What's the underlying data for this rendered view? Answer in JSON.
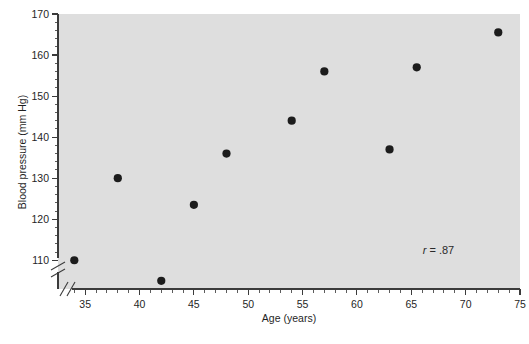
{
  "figure": {
    "background_color": "#ffffff",
    "plot_area_color": "#dedede",
    "point_color": "#1c1c1c"
  },
  "annotation": {
    "symbol": "r",
    "equals": "=",
    "value": ".87",
    "full_text": "r = .87"
  },
  "chart_data": {
    "type": "scatter",
    "title": "",
    "xlabel": "Age (years)",
    "ylabel": "Blood pressure (mm Hg)",
    "xlim": [
      32.5,
      75
    ],
    "ylim": [
      103,
      170
    ],
    "grid": false,
    "legend": null,
    "x_ticks": [
      35,
      40,
      45,
      50,
      55,
      60,
      65,
      70,
      75
    ],
    "x_tick_labels": [
      "35",
      "40",
      "45",
      "50",
      "55",
      "60",
      "65",
      "70",
      "75"
    ],
    "x_minor_tick_step": 1,
    "y_ticks": [
      110,
      120,
      130,
      140,
      150,
      160,
      170
    ],
    "y_tick_labels": [
      "110",
      "120",
      "130",
      "140",
      "150",
      "160",
      "170"
    ],
    "y_minor_tick_step": 2,
    "axis_break_x": true,
    "axis_break_y": true,
    "annotations": [
      {
        "text": "r = .87",
        "x": 67.5,
        "y": 111.5
      }
    ],
    "points": [
      {
        "x": 34,
        "y": 110
      },
      {
        "x": 38,
        "y": 130
      },
      {
        "x": 42,
        "y": 105
      },
      {
        "x": 45,
        "y": 123.5
      },
      {
        "x": 48,
        "y": 136
      },
      {
        "x": 54,
        "y": 144
      },
      {
        "x": 57,
        "y": 156
      },
      {
        "x": 63,
        "y": 137
      },
      {
        "x": 65.5,
        "y": 157
      },
      {
        "x": 73,
        "y": 165.5
      }
    ],
    "x": [
      34,
      38,
      42,
      45,
      48,
      54,
      57,
      63,
      65.5,
      73
    ],
    "values": [
      110,
      130,
      105,
      123.5,
      136,
      144,
      156,
      137,
      157,
      165.5
    ]
  }
}
